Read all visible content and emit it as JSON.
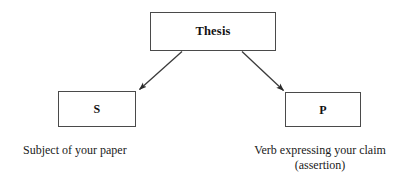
{
  "diagram": {
    "type": "flowchart",
    "background_color": "#ffffff",
    "line_color": "#3a3a3a",
    "box_border_color": "#4a4a4a",
    "text_color": "#1a1a1a",
    "nodes": [
      {
        "id": "thesis",
        "label": "Thesis",
        "bold": true,
        "caption": ""
      },
      {
        "id": "subject",
        "label": "S",
        "bold": true,
        "caption": "Subject of your paper"
      },
      {
        "id": "predicate",
        "label": "P",
        "bold": true,
        "caption": "Verb expressing your claim\n(assertion)"
      }
    ],
    "edges": [
      {
        "id": "thesis-to-subject",
        "from": "thesis",
        "to": "subject",
        "arrowhead": "filled-triangle",
        "label": ""
      },
      {
        "id": "thesis-to-predicate",
        "from": "thesis",
        "to": "predicate",
        "arrowhead": "filled-triangle",
        "label": ""
      }
    ]
  }
}
